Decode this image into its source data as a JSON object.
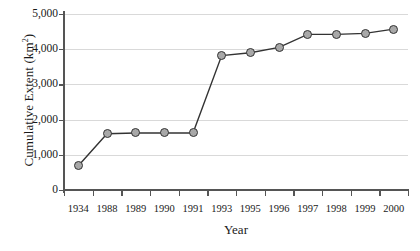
{
  "chart_data": {
    "type": "line",
    "title": "",
    "xlabel": "Year",
    "ylabel": "Cumulative Extent (km2)",
    "ylabel_base": "Cumulative Extent (km",
    "ylabel_sup": "2",
    "ylabel_close": ")",
    "categories": [
      "1934",
      "1988",
      "1989",
      "1990",
      "1991",
      "1993",
      "1995",
      "1996",
      "1997",
      "1998",
      "1999",
      "2000"
    ],
    "values": [
      690,
      1600,
      1620,
      1620,
      1620,
      3820,
      3900,
      4050,
      4420,
      4420,
      4450,
      4570
    ],
    "series": [
      {
        "name": "Cumulative Extent",
        "values": [
          690,
          1600,
          1620,
          1620,
          1620,
          3820,
          3900,
          4050,
          4420,
          4420,
          4450,
          4570
        ]
      }
    ],
    "ylim": [
      0,
      5000
    ],
    "yticks": [
      0,
      1000,
      2000,
      3000,
      4000,
      5000
    ],
    "ytick_labels": [
      "0",
      "1,000",
      "2,000",
      "3,000",
      "4,000",
      "5,000"
    ],
    "grid": "horizontal",
    "legend": "none",
    "marker": "circle",
    "marker_fill": "#a8a8a8",
    "marker_edge": "#333333",
    "line_color": "#333333",
    "gridline_color": "#d9d9d9",
    "axis_color": "#555555",
    "background": "#ffffff"
  }
}
